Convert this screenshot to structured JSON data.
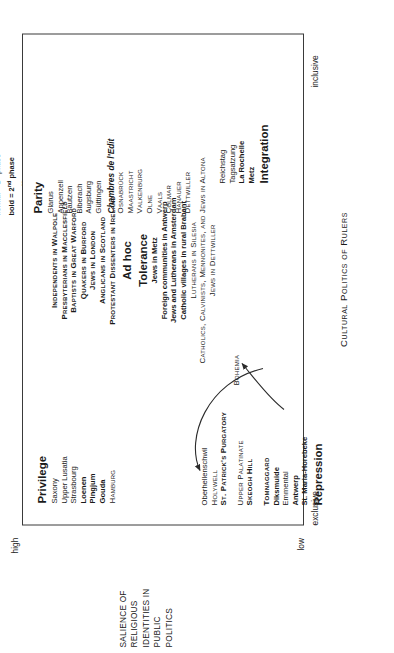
{
  "figure": {
    "x_axis_caption": "Cultural Politics of Rulers",
    "x_tick_left": "exclusive",
    "x_tick_right": "inclusive",
    "y_tick_high": "high",
    "y_tick_low": "low",
    "y_axis_caption_lines": [
      "SALIENCE OF",
      "RELIGIOUS",
      "IDENTITIES IN",
      "PUBLIC",
      "POLITICS"
    ]
  },
  "legend": {
    "line1_prefix": "normal = 1",
    "line1_sup": "st",
    "line1_suffix": " phase",
    "line2_prefix": "bold = 2",
    "line2_sup": "nd",
    "line2_suffix": " phase",
    "line3_prefix": "Caps = 3",
    "line3_sup": "rd",
    "line3_suffix": " phase Continent",
    "line4": "Bold Caps = British Isles"
  },
  "clusters": {
    "privilege": {
      "title": "Privilege",
      "items": [
        {
          "label": "Saxony",
          "style": "p1"
        },
        {
          "label": "Upper Lusatia",
          "style": "p1"
        },
        {
          "label": "Strasbourg",
          "style": "p1"
        },
        {
          "label": "Loenen",
          "style": "p2"
        },
        {
          "label": "Pingjum",
          "style": "p2"
        },
        {
          "label": "Gouda",
          "style": "p2"
        },
        {
          "label": "Hamburg",
          "style": "p3"
        }
      ]
    },
    "repression": {
      "title": "Repression",
      "items": [
        {
          "label": "Oberhellenschwil",
          "style": "p1"
        },
        {
          "label": "Holywell",
          "style": "p3"
        },
        {
          "label": "St. Patrick's Purgatory",
          "style": "p4"
        },
        {
          "label": "",
          "style": "spacer"
        },
        {
          "label": "Upper Palatinate",
          "style": "p3"
        },
        {
          "label": "Skeogh Hill",
          "style": "p4"
        },
        {
          "label": "",
          "style": "spacer"
        },
        {
          "label": "Tomnaggard",
          "style": "p4"
        },
        {
          "label": "Diksmuide",
          "style": "p2"
        },
        {
          "label": "Emmental",
          "style": "p1"
        },
        {
          "label": "Antwerp",
          "style": "p2"
        },
        {
          "label": "St. Maria-Horebeke",
          "style": "p2"
        }
      ],
      "side_note": "Bohemia"
    },
    "middle": {
      "adhoc_title": "Ad hoc",
      "tolerance_title": "Tolerance",
      "top_items": [
        {
          "label": "Independents in Walpole",
          "style": "p4"
        },
        {
          "label": "Presbyterians in Macclesfield",
          "style": "p4"
        },
        {
          "label": "Baptists in Great Warford",
          "style": "p4"
        },
        {
          "label": "Quakers in Burford",
          "style": "p4"
        },
        {
          "label": "Jews in London",
          "style": "p4"
        },
        {
          "label": "Anglicans in Scotland",
          "style": "p4"
        },
        {
          "label": "Protestant Dissenters in Ireland",
          "style": "p4"
        }
      ],
      "tolerance_items": [
        {
          "label": "Jews in Metz",
          "style": "p2"
        },
        {
          "label": "Foreign communities in Antwerp",
          "style": "p2"
        },
        {
          "label": "Jews and Lutherans in Amsterdam",
          "style": "p2"
        },
        {
          "label": "Catholic villages in rural Brabant",
          "style": "p2"
        },
        {
          "label": "Lutherans in Silesia",
          "style": "p3"
        },
        {
          "label": "Catholics, Calvinists, Mennonites, and Jews in Altona",
          "style": "p3"
        },
        {
          "label": "Jews in Dettwiller",
          "style": "p3"
        }
      ]
    },
    "parity": {
      "title": "Parity",
      "items": [
        {
          "label": "Glarus",
          "style": "p1"
        },
        {
          "label": "Appenzell",
          "style": "p1"
        },
        {
          "label": "Bautzen",
          "style": "p1"
        },
        {
          "label": "Biberach",
          "style": "p1"
        },
        {
          "label": "Augsburg",
          "style": "p1"
        },
        {
          "label": "Güttingen",
          "style": "p1"
        },
        {
          "label": "Chambres de l'Edit",
          "style": "sub"
        },
        {
          "label": "Osnabrück",
          "style": "p3"
        },
        {
          "label": "Maastricht",
          "style": "p3"
        },
        {
          "label": "Valkenburg",
          "style": "p3"
        },
        {
          "label": "Olne",
          "style": "p3"
        },
        {
          "label": "Vaals",
          "style": "p3"
        },
        {
          "label": "Colmar",
          "style": "p3"
        },
        {
          "label": "Hanauer",
          "style": "p3"
        },
        {
          "label": "Dettwiller",
          "style": "p3"
        }
      ]
    },
    "integration": {
      "title": "Integration",
      "items": [
        {
          "label": "Reichstag",
          "style": "p1"
        },
        {
          "label": "Tagsatzung",
          "style": "p1"
        },
        {
          "label": "La Rochelle",
          "style": "p2"
        },
        {
          "label": "Metz",
          "style": "p2"
        }
      ]
    }
  }
}
